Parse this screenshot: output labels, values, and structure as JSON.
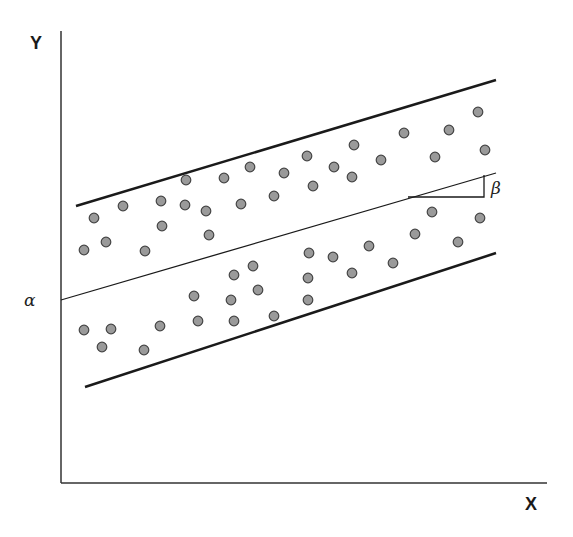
{
  "labels": {
    "y_axis": "Y",
    "x_axis": "X",
    "intercept": "α",
    "slope": "β"
  },
  "colors": {
    "line": "#1a1a1a",
    "point_fill": "#9a9a9a",
    "point_stroke": "#444444",
    "background": "#ffffff"
  },
  "chart_data": {
    "type": "scatter",
    "title": "",
    "xlabel": "X",
    "ylabel": "Y",
    "grid": false,
    "annotations": [
      {
        "symbol": "α",
        "meaning": "intercept of regression line on Y axis"
      },
      {
        "symbol": "β",
        "meaning": "slope of regression line (rise over run triangle)"
      }
    ],
    "lines": [
      {
        "name": "upper-bound",
        "x1": 76,
        "y1": 206,
        "x2": 496,
        "y2": 80,
        "width": 2.5
      },
      {
        "name": "regression",
        "x1": 61,
        "y1": 300,
        "x2": 496,
        "y2": 173,
        "width": 1.3
      },
      {
        "name": "lower-bound",
        "x1": 85,
        "y1": 387,
        "x2": 496,
        "y2": 253,
        "width": 2.5
      }
    ],
    "slope_triangle": {
      "x_start": 408,
      "x_end": 484,
      "y_base": 197,
      "y_top": 175
    },
    "axes": {
      "origin_x": 61,
      "origin_y": 483,
      "y_top": 31,
      "x_right": 547
    },
    "points": [
      [
        94,
        218
      ],
      [
        123,
        206
      ],
      [
        161,
        201
      ],
      [
        186,
        180
      ],
      [
        185,
        205
      ],
      [
        206,
        211
      ],
      [
        224,
        178
      ],
      [
        241,
        204
      ],
      [
        250,
        167
      ],
      [
        274,
        196
      ],
      [
        284,
        173
      ],
      [
        307,
        156
      ],
      [
        313,
        186
      ],
      [
        334,
        167
      ],
      [
        352,
        177
      ],
      [
        354,
        145
      ],
      [
        381,
        160
      ],
      [
        404,
        133
      ],
      [
        435,
        157
      ],
      [
        449,
        130
      ],
      [
        478,
        112
      ],
      [
        485,
        150
      ],
      [
        84,
        250
      ],
      [
        106,
        242
      ],
      [
        145,
        251
      ],
      [
        162,
        226
      ],
      [
        209,
        235
      ],
      [
        234,
        275
      ],
      [
        253,
        266
      ],
      [
        258,
        290
      ],
      [
        274,
        316
      ],
      [
        308,
        278
      ],
      [
        308,
        300
      ],
      [
        309,
        253
      ],
      [
        333,
        257
      ],
      [
        352,
        273
      ],
      [
        369,
        246
      ],
      [
        393,
        263
      ],
      [
        415,
        234
      ],
      [
        432,
        212
      ],
      [
        458,
        242
      ],
      [
        480,
        218
      ],
      [
        84,
        330
      ],
      [
        102,
        347
      ],
      [
        111,
        329
      ],
      [
        144,
        350
      ],
      [
        160,
        326
      ],
      [
        194,
        296
      ],
      [
        198,
        321
      ],
      [
        231,
        300
      ],
      [
        234,
        321
      ]
    ]
  }
}
